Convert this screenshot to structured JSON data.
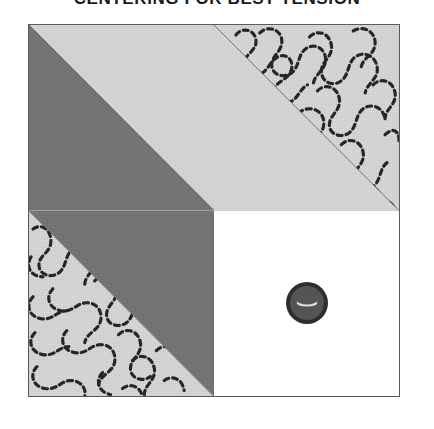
{
  "title": {
    "text": "CENTERING FOR BEST TENSION"
  },
  "block": {
    "name": "half-square-triangle-quilt-block",
    "quadrants": [
      {
        "position": "top-left",
        "description": "half-square triangle, dark gray lower-left / light gray upper-right",
        "fabrics": [
          "dark-gray",
          "light-gray"
        ],
        "quilting": "none"
      },
      {
        "position": "top-right",
        "description": "light gray square with diagonal seam, stipple meander quilting on upper-right half",
        "fabrics": [
          "light-gray"
        ],
        "quilting": "stipple-meander"
      },
      {
        "position": "bottom-left",
        "description": "light gray lower-left with stipple meander quilting, dark gray upper-right triangle",
        "fabrics": [
          "light-gray",
          "dark-gray"
        ],
        "quilting": "stipple-meander"
      },
      {
        "position": "bottom-right",
        "description": "plain white square with centered button",
        "fabrics": [
          "white"
        ],
        "quilting": "none"
      }
    ]
  },
  "button": {
    "label": "button",
    "shape": "round",
    "slot": "horizontal-curved-slot"
  },
  "colors": {
    "dark_gray": "#737373",
    "light_gray": "#d8d8d8",
    "white": "#ffffff",
    "seam_line": "#5a5a5a",
    "stitch": "#262626",
    "button_outer": "#2e2e2e",
    "button_inner": "#545454",
    "title_text": "#1a1a1a"
  }
}
